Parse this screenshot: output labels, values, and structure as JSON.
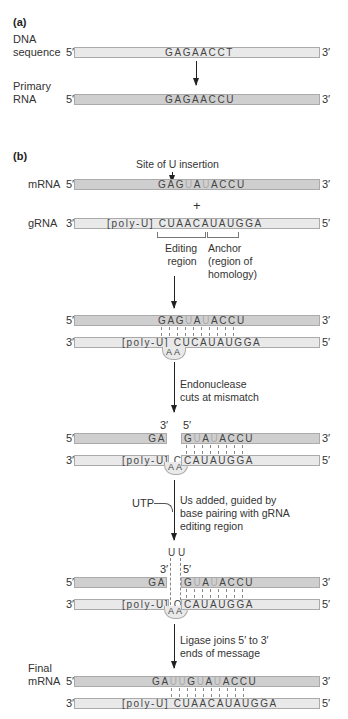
{
  "panel_a": {
    "label": "(a)",
    "dna": {
      "name_line1": "DNA",
      "name_line2": "sequence",
      "five": "5′",
      "three": "3′",
      "sequence": "GAGAACCT"
    },
    "rna": {
      "name_line1": "Primary",
      "name_line2": "RNA",
      "five": "5′",
      "three": "3′",
      "sequence": "GAGAACCU"
    }
  },
  "panel_b": {
    "label": "(b)",
    "site_label": "Site of U insertion",
    "mrna": {
      "name": "mRNA",
      "five": "5′",
      "three": "3′",
      "seq_parts": [
        "GAG",
        "U",
        "A",
        "U",
        "ACCU"
      ]
    },
    "plus": "+",
    "grna": {
      "name": "gRNA",
      "three": "3′",
      "five": "5′",
      "sequence": "[poly-U] CUAACAUAUGGA"
    },
    "editing_label_1": "Editing",
    "editing_label_2": "region",
    "anchor_label_1": "Anchor",
    "anchor_label_2": "(region of",
    "anchor_label_3": "homology)",
    "step1": {
      "mrna": {
        "five": "5′",
        "three": "3′",
        "seq_parts": [
          "GAG",
          "U",
          "A",
          "U",
          "ACCU"
        ]
      },
      "grna": {
        "three": "3′",
        "five": "5′",
        "sequence": "[poly-U] CUCAUAUGGA",
        "loop": "AA"
      }
    },
    "step2_note_1": "Endonuclease",
    "step2_note_2": "cuts at mismatch",
    "step2": {
      "cut_three": "3′",
      "cut_five": "5′",
      "mrna": {
        "five": "5′",
        "three": "3′",
        "left": "GA",
        "right_parts": [
          "G",
          "U",
          "A",
          "U",
          "ACCU"
        ]
      },
      "grna": {
        "three": "3′",
        "five": "5′",
        "left": "[poly-U] CU",
        "right": "CAUAUGGA",
        "loop": "AA"
      }
    },
    "utp_label": "UTP",
    "step3_note_1": "Us added, guided by",
    "step3_note_2": "base pairing with gRNA",
    "step3_note_3": "editing region",
    "step3": {
      "added": "U U",
      "cut_three": "3′",
      "cut_five": "5′",
      "mrna": {
        "five": "5′",
        "three": "3′",
        "left": "GA",
        "right_parts": [
          "G",
          "U",
          "A",
          "U",
          "ACCU"
        ]
      },
      "grna": {
        "three": "3′",
        "five": "5′",
        "left": "[poly-U] CU",
        "right": "CAUAUGGA",
        "loop": "AA"
      }
    },
    "step4_note_1": "Ligase joins 5′ to 3′",
    "step4_note_2": "ends of message",
    "final": {
      "name_line1": "Final",
      "name_line2": "mRNA",
      "mrna": {
        "five": "5′",
        "three": "3′",
        "seq_parts": [
          "GA",
          "UU",
          "G",
          "U",
          "A",
          "U",
          "ACCU"
        ]
      },
      "grna": {
        "three": "3′",
        "five": "5′",
        "sequence": "[poly-U] CUAACAUAUGGA"
      }
    }
  }
}
